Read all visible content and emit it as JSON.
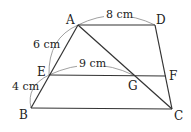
{
  "diagram": {
    "type": "geometry-trapezoid",
    "points": {
      "A": {
        "label": "A",
        "x": 78,
        "y": 25
      },
      "D": {
        "label": "D",
        "x": 155,
        "y": 25
      },
      "E": {
        "label": "E",
        "x": 49,
        "y": 75
      },
      "F": {
        "label": "F",
        "x": 166,
        "y": 76
      },
      "B": {
        "label": "B",
        "x": 31,
        "y": 108
      },
      "C": {
        "label": "C",
        "x": 172,
        "y": 109
      },
      "G": {
        "label": "G",
        "x": 133,
        "y": 75
      }
    },
    "measurements": {
      "AD": "8 cm",
      "AE": "6 cm",
      "EG": "9 cm",
      "EB": "4 cm"
    },
    "stroke_color": "#333333"
  }
}
